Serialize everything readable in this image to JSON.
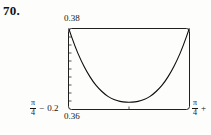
{
  "figure": {
    "problem_number": "70.",
    "labels": {
      "y_max": "0.38",
      "y_min": "0.36",
      "x_min_fraction_numerator": "π",
      "x_min_fraction_denominator": "4",
      "x_min_operator": "−",
      "x_min_offset": "0.2",
      "x_max_fraction_numerator": "π",
      "x_max_fraction_denominator": "4",
      "x_max_operator": "+",
      "x_max_offset": ""
    },
    "colors": {
      "frame": "#1f1f1f",
      "curve": "#0d0d0d",
      "background": "#fdfdfc",
      "text": "#141414"
    }
  },
  "chart_data": {
    "type": "line",
    "title": "",
    "subtitle": "",
    "xlabel": "",
    "ylabel": "",
    "grid": false,
    "legend": null,
    "xlim": [
      0.585398,
      0.985398
    ],
    "ylim": [
      0.36,
      0.38
    ],
    "x_tick_labels": [
      "π/4 − 0.2",
      "π/4 +"
    ],
    "y_tick_labels": [
      "0.36",
      "0.38"
    ],
    "x_tick_count_bottom": 1,
    "y_tick_count_left": 9,
    "series": [
      {
        "name": "curve",
        "x": [
          0.5854,
          0.6054,
          0.6254,
          0.6454,
          0.6654,
          0.6854,
          0.7054,
          0.7254,
          0.7454,
          0.7654,
          0.7854,
          0.8054,
          0.8254,
          0.8454,
          0.8654,
          0.8854,
          0.9054,
          0.9254,
          0.9454,
          0.9654,
          0.9854
        ],
        "y": [
          0.38,
          0.3757,
          0.3722,
          0.3693,
          0.3669,
          0.3651,
          0.3637,
          0.3627,
          0.3621,
          0.3618,
          0.3617,
          0.3618,
          0.3621,
          0.3627,
          0.3637,
          0.3651,
          0.3669,
          0.3693,
          0.3722,
          0.3757,
          0.38
        ]
      }
    ]
  }
}
